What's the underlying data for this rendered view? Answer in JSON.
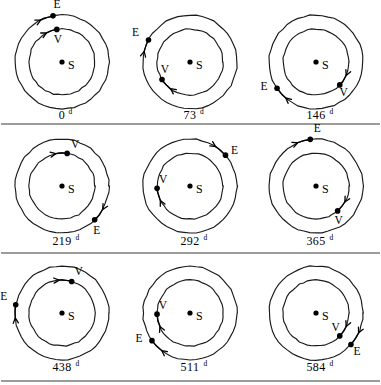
{
  "figure": {
    "width": 381,
    "height": 385,
    "background_color": "#ffffff",
    "ink_color": "#111111",
    "divider_color": "#3a3a3a",
    "labels": {
      "sun": "S",
      "earth": "E",
      "venus": "V",
      "day_unit": "d"
    },
    "dividers": [
      {
        "name": "divider-row-1-2",
        "y": 124
      },
      {
        "name": "divider-row-2-3",
        "y": 253
      },
      {
        "name": "divider-bottom",
        "y": 381
      }
    ],
    "geometry": {
      "outer_orbit_radius": 47,
      "inner_orbit_radius": 33,
      "sun_dot_radius": 2.6,
      "body_dot_radius": 2.8
    }
  },
  "panels": [
    {
      "id": "panel-0d",
      "caption_value": "0",
      "caption_unit": "d",
      "caption_full": "0d",
      "center_x": 62,
      "center_y": 62,
      "caption_x": 62,
      "caption_y": 119,
      "earth": {
        "angle_deg": 101,
        "orbit": "outer",
        "label_dx": 4,
        "label_dy": -8,
        "arrow_dir": "ccw",
        "arrow_span_deg": 16
      },
      "venus": {
        "angle_deg": 99,
        "orbit": "inner",
        "label_dx": 1,
        "label_dy": 14,
        "arrow_dir": "ccw",
        "arrow_span_deg": 19
      }
    },
    {
      "id": "panel-73d",
      "caption_value": "73",
      "caption_unit": "d",
      "caption_full": "73d",
      "center_x": 190,
      "center_y": 62,
      "caption_x": 190,
      "caption_y": 119,
      "earth": {
        "angle_deg": 152,
        "orbit": "outer",
        "label_dx": -13,
        "label_dy": -4,
        "arrow_dir": "ccw",
        "arrow_span_deg": 15
      },
      "venus": {
        "angle_deg": 212,
        "orbit": "inner",
        "label_dx": 3,
        "label_dy": -6,
        "arrow_dir": "ccw",
        "arrow_span_deg": 22
      }
    },
    {
      "id": "panel-146d",
      "caption_value": "146",
      "caption_unit": "d",
      "caption_full": "146d",
      "center_x": 316,
      "center_y": 62,
      "caption_x": 316,
      "caption_y": 119,
      "earth": {
        "angle_deg": 214,
        "orbit": "outer",
        "label_dx": -13,
        "label_dy": 2,
        "arrow_dir": "ccw",
        "arrow_span_deg": 16
      },
      "venus": {
        "angle_deg": 316,
        "orbit": "inner",
        "label_dx": 4,
        "label_dy": 11,
        "arrow_dir": "ccw",
        "arrow_span_deg": 20
      }
    },
    {
      "id": "panel-219d",
      "caption_value": "219",
      "caption_unit": "d",
      "caption_full": "219d",
      "center_x": 62,
      "center_y": 186,
      "caption_x": 62,
      "caption_y": 245,
      "earth": {
        "angle_deg": 314,
        "orbit": "outer",
        "label_dx": 2,
        "label_dy": 14,
        "arrow_dir": "ccw",
        "arrow_span_deg": 16
      },
      "venus": {
        "angle_deg": 81,
        "orbit": "inner",
        "label_dx": 8,
        "label_dy": -5,
        "arrow_dir": "ccw",
        "arrow_span_deg": 20
      }
    },
    {
      "id": "panel-292d",
      "caption_value": "292",
      "caption_unit": "d",
      "caption_full": "292d",
      "center_x": 190,
      "center_y": 186,
      "caption_x": 190,
      "caption_y": 245,
      "earth": {
        "angle_deg": 41,
        "orbit": "outer",
        "label_dx": 9,
        "label_dy": -1,
        "arrow_dir": "ccw",
        "arrow_span_deg": 16
      },
      "venus": {
        "angle_deg": 184,
        "orbit": "inner",
        "label_dx": 6,
        "label_dy": -5,
        "arrow_dir": "ccw",
        "arrow_span_deg": 22
      }
    },
    {
      "id": "panel-365d",
      "caption_value": "365",
      "caption_unit": "d",
      "caption_full": "365d",
      "center_x": 316,
      "center_y": 186,
      "caption_x": 316,
      "caption_y": 245,
      "earth": {
        "angle_deg": 97,
        "orbit": "outer",
        "label_dx": 7,
        "label_dy": -7,
        "arrow_dir": "ccw",
        "arrow_span_deg": 16
      },
      "venus": {
        "angle_deg": 311,
        "orbit": "inner",
        "label_dx": 1,
        "label_dy": 13,
        "arrow_dir": "ccw",
        "arrow_span_deg": 20
      }
    },
    {
      "id": "panel-438d",
      "caption_value": "438",
      "caption_unit": "d",
      "caption_full": "438d",
      "center_x": 62,
      "center_y": 313,
      "caption_x": 62,
      "caption_y": 371,
      "earth": {
        "angle_deg": 170,
        "orbit": "outer",
        "label_dx": -12,
        "label_dy": -5,
        "arrow_dir": "ccw",
        "arrow_span_deg": 16
      },
      "venus": {
        "angle_deg": 73,
        "orbit": "inner",
        "label_dx": 7,
        "label_dy": -6,
        "arrow_dir": "ccw",
        "arrow_span_deg": 22
      }
    },
    {
      "id": "panel-511d",
      "caption_value": "511",
      "caption_unit": "d",
      "caption_full": "511d",
      "center_x": 190,
      "center_y": 313,
      "caption_x": 190,
      "caption_y": 371,
      "earth": {
        "angle_deg": 216,
        "orbit": "outer",
        "label_dx": -13,
        "label_dy": 1,
        "arrow_dir": "ccw",
        "arrow_span_deg": 17
      },
      "venus": {
        "angle_deg": 182,
        "orbit": "inner",
        "label_dx": 6,
        "label_dy": -5,
        "arrow_dir": "ccw",
        "arrow_span_deg": 22
      }
    },
    {
      "id": "panel-584d",
      "caption_value": "584",
      "caption_unit": "d",
      "caption_full": "584d",
      "center_x": 316,
      "center_y": 313,
      "caption_x": 316,
      "caption_y": 371,
      "earth": {
        "angle_deg": 318,
        "orbit": "outer",
        "label_dx": 6,
        "label_dy": 11,
        "arrow_dir": "ccw",
        "arrow_span_deg": 17
      },
      "venus": {
        "angle_deg": 316,
        "orbit": "inner",
        "label_dx": -4,
        "label_dy": -5,
        "arrow_dir": "ccw",
        "arrow_span_deg": 20
      }
    }
  ]
}
